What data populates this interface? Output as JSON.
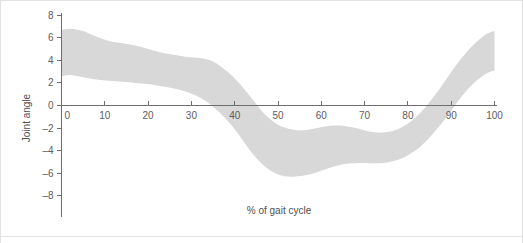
{
  "figure": {
    "background_color": "#ffffff",
    "border_color": "#e2e2e2",
    "axis_color": "#6e6e6e",
    "text_color": "#5d5d5d"
  },
  "chart_data": {
    "type": "area",
    "title": "",
    "subtitle": "",
    "xlabel": "% of gait cycle",
    "ylabel": "Joint angle",
    "xlim": [
      0,
      100
    ],
    "ylim": [
      -8,
      8
    ],
    "xticks": [
      0,
      10,
      20,
      30,
      40,
      50,
      60,
      70,
      80,
      90,
      100
    ],
    "yticks": [
      8,
      6,
      4,
      2,
      0,
      -2,
      -4,
      -6,
      -8
    ],
    "xtick_labels": [
      "0",
      "10",
      "20",
      "30",
      "40",
      "50",
      "60",
      "70",
      "80",
      "90",
      "100"
    ],
    "ytick_labels": [
      "8",
      "6",
      "4",
      "2",
      "0",
      "-2",
      "-4",
      "-6",
      "-8"
    ],
    "grid": false,
    "legend": null,
    "legend_position": "none",
    "annotations": [],
    "band_color": "#d8d8d8",
    "series": [
      {
        "name": "Joint angle range band (upper bound)",
        "x": [
          0,
          2,
          5,
          8,
          11,
          14,
          17,
          20,
          23,
          26,
          29,
          32,
          35,
          38,
          41,
          44,
          47,
          50,
          53,
          56,
          59,
          62,
          65,
          68,
          71,
          74,
          77,
          80,
          83,
          86,
          89,
          92,
          95,
          98,
          100
        ],
        "values": [
          6.7,
          6.8,
          6.6,
          6.1,
          5.7,
          5.5,
          5.3,
          5.0,
          4.7,
          4.5,
          4.3,
          4.2,
          3.9,
          3.1,
          2.0,
          0.6,
          -0.8,
          -1.7,
          -2.1,
          -2.2,
          -2.0,
          -1.8,
          -1.8,
          -2.0,
          -2.3,
          -2.4,
          -2.2,
          -1.6,
          -0.6,
          0.8,
          2.4,
          4.0,
          5.3,
          6.3,
          6.6
        ]
      },
      {
        "name": "Joint angle range band (lower bound)",
        "x": [
          0,
          2,
          5,
          8,
          11,
          14,
          17,
          20,
          23,
          26,
          29,
          32,
          35,
          38,
          41,
          44,
          47,
          50,
          53,
          56,
          59,
          62,
          65,
          68,
          71,
          74,
          77,
          80,
          83,
          86,
          89,
          92,
          95,
          98,
          100
        ],
        "values": [
          2.6,
          2.7,
          2.5,
          2.3,
          2.2,
          2.1,
          2.0,
          1.9,
          1.7,
          1.5,
          1.2,
          0.7,
          -0.1,
          -1.2,
          -2.6,
          -4.2,
          -5.4,
          -6.1,
          -6.3,
          -6.2,
          -5.9,
          -5.5,
          -5.2,
          -5.1,
          -5.1,
          -5.1,
          -4.9,
          -4.4,
          -3.6,
          -2.4,
          -1.0,
          0.6,
          1.9,
          2.8,
          3.1
        ]
      }
    ]
  }
}
